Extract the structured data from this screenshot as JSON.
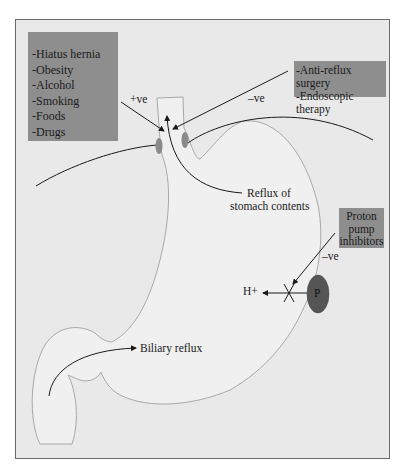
{
  "risk_factors": {
    "items": [
      "-Hiatus hernia",
      "-Obesity",
      "-Alcohol",
      "-Smoking",
      "-Foods",
      "-Drugs"
    ],
    "effect": "+ve"
  },
  "therapies": {
    "items": [
      "-Anti-reflux surgery",
      "-Endoscopic therapy"
    ],
    "effect": "–ve"
  },
  "ppi": {
    "lines": [
      "Proton",
      "pump",
      "inhibitors"
    ],
    "effect": "–ve"
  },
  "labels": {
    "reflux_line1": "Reflux of",
    "reflux_line2": "stomach contents",
    "biliary": "Biliary reflux",
    "h_plus": "H+",
    "pump": "P"
  },
  "colors": {
    "background": "#e9e9e9",
    "box_fill": "#8e8e8e",
    "pump_fill": "#555555",
    "sphincter": "#8a8a8a",
    "outline": "#a8a8a8",
    "line": "#1a1a1a"
  }
}
